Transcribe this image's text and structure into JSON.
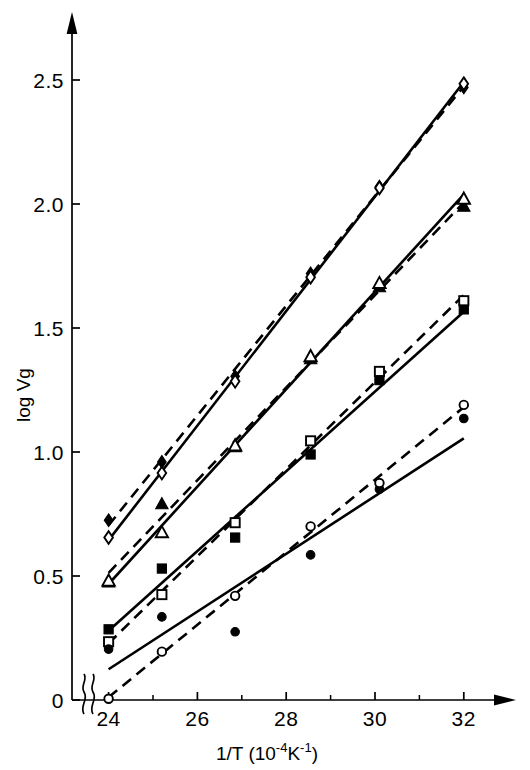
{
  "figure": {
    "background": "#ffffff",
    "ink": "#000000"
  },
  "axes": {
    "x_title_main": "1/T (10",
    "x_title_exp1": "-4",
    "x_title_mid": "K",
    "x_title_exp2": "-1",
    "x_title_end": ")",
    "x_title_full": "1/T (10-4K-1)",
    "y_title": "log Vg",
    "x_ticks": [
      "24",
      "26",
      "28",
      "30",
      "32"
    ],
    "x_tick_values": [
      24,
      26,
      28,
      30,
      32
    ],
    "x_minor_values": [
      25,
      27,
      29,
      31
    ],
    "y_ticks": [
      "0",
      "0.5",
      "1.0",
      "1.5",
      "2.0",
      "2.5"
    ],
    "y_tick_values": [
      0,
      0.5,
      1.0,
      1.5,
      2.0,
      2.5
    ],
    "axis_break": "break-symbol",
    "x_arrow": "arrow-right",
    "y_arrow": "arrow-up"
  },
  "chart_data": {
    "type": "scatter",
    "title": "",
    "xlabel": "1/T (10-4K-1)",
    "ylabel": "log Vg",
    "xlim": [
      23.3,
      32.9
    ],
    "ylim": [
      0,
      2.72
    ],
    "grid": false,
    "legend": "none",
    "axis_break_x": true,
    "series": [
      {
        "name": "filled-diamond",
        "marker": "diamond-filled",
        "line": "dashed",
        "x": [
          24.0,
          25.2,
          26.85,
          28.55,
          30.1,
          32.0
        ],
        "y": [
          0.725,
          0.96,
          1.305,
          1.72,
          2.07,
          2.47
        ]
      },
      {
        "name": "open-diamond",
        "marker": "diamond-open",
        "line": "solid",
        "x": [
          24.0,
          25.2,
          26.85,
          28.55,
          30.1,
          32.0
        ],
        "y": [
          0.655,
          0.915,
          1.285,
          1.705,
          2.065,
          2.485
        ]
      },
      {
        "name": "filled-triangle",
        "marker": "triangle-filled",
        "line": "dashed",
        "x": [
          24.0,
          25.2,
          26.85,
          28.55,
          30.1,
          32.0
        ],
        "y": [
          0.475,
          0.79,
          1.02,
          1.375,
          1.665,
          1.99
        ]
      },
      {
        "name": "open-triangle",
        "marker": "triangle-open",
        "line": "solid",
        "x": [
          24.0,
          25.2,
          26.85,
          28.55,
          30.1,
          32.0
        ],
        "y": [
          0.48,
          0.675,
          1.025,
          1.385,
          1.68,
          2.02
        ]
      },
      {
        "name": "filled-square",
        "marker": "square-filled",
        "line": "solid",
        "x": [
          24.0,
          25.2,
          26.85,
          28.55,
          30.1,
          32.0
        ],
        "y": [
          0.285,
          0.53,
          0.655,
          0.99,
          1.29,
          1.575
        ]
      },
      {
        "name": "open-square",
        "marker": "square-open",
        "line": "dashed",
        "x": [
          24.0,
          25.2,
          26.85,
          28.55,
          30.1,
          32.0
        ],
        "y": [
          0.235,
          0.425,
          0.715,
          1.045,
          1.325,
          1.61
        ]
      },
      {
        "name": "filled-circle",
        "marker": "circle-filled",
        "line": "solid",
        "x": [
          24.0,
          25.2,
          26.85,
          28.55,
          30.1,
          32.0
        ],
        "y": [
          0.205,
          0.335,
          0.275,
          0.585,
          0.85,
          1.135
        ]
      },
      {
        "name": "open-circle",
        "marker": "circle-open",
        "line": "dashed",
        "x": [
          24.0,
          25.2,
          26.85,
          28.55,
          30.1,
          32.0
        ],
        "y": [
          0.005,
          0.195,
          0.42,
          0.7,
          0.875,
          1.19
        ]
      }
    ]
  }
}
